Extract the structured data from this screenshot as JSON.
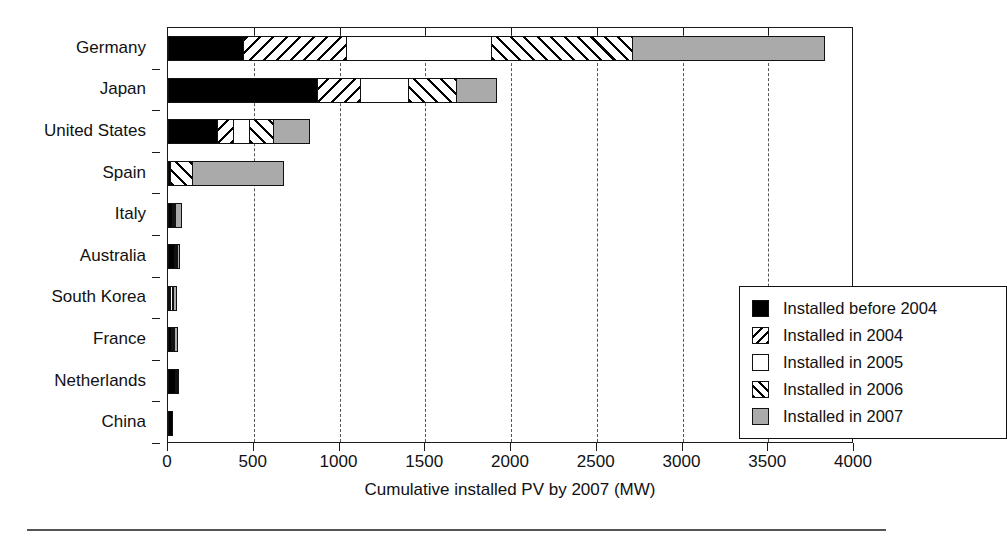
{
  "chart_data": {
    "type": "bar",
    "orientation": "horizontal",
    "stacked": true,
    "title": "",
    "xlabel": "Cumulative installed PV by 2007 (MW)",
    "ylabel": "",
    "xlim": [
      0,
      4000
    ],
    "xticks": [
      0,
      500,
      1000,
      1500,
      2000,
      2500,
      3000,
      3500,
      4000
    ],
    "xticklabels": [
      "0",
      "500",
      "1000",
      "1500",
      "2000",
      "2500",
      "3000",
      "3500",
      "4000"
    ],
    "grid": "vertical-dashed",
    "legend_position": "middle-right-inside",
    "categories": [
      "Germany",
      "Japan",
      "United States",
      "Spain",
      "Italy",
      "Australia",
      "South Korea",
      "France",
      "Netherlands",
      "China"
    ],
    "series": [
      {
        "name": "Installed before 2004",
        "key": "before2004",
        "fill": "solid-black",
        "values": [
          444,
          876,
          292,
          20,
          30,
          44,
          10,
          26,
          46,
          30
        ]
      },
      {
        "name": "Installed in 2004",
        "key": "y2004",
        "fill": "backslash-hatch",
        "values": [
          607,
          257,
          99,
          0,
          5,
          2,
          4,
          5,
          3,
          0
        ]
      },
      {
        "name": "Installed in 2005",
        "key": "y2005",
        "fill": "white",
        "values": [
          853,
          287,
          105,
          0,
          5,
          2,
          16,
          5,
          2,
          0
        ]
      },
      {
        "name": "Installed in 2006",
        "key": "y2006",
        "fill": "forward-slash-hatch",
        "values": [
          829,
          286,
          146,
          132,
          8,
          3,
          6,
          6,
          2,
          0
        ]
      },
      {
        "name": "Installed in 2007",
        "key": "y2007",
        "fill": "grey",
        "values": [
          1127,
          239,
          216,
          537,
          40,
          2,
          28,
          22,
          0,
          0
        ]
      }
    ],
    "totals": [
      3860,
      1945,
      858,
      689,
      88,
      53,
      64,
      64,
      53,
      30
    ],
    "units": "MW",
    "colors": {
      "before2004": "#000000",
      "y2005": "#ffffff",
      "y2007": "#aaaaaa",
      "outline": "#111111",
      "gridline": "#555555",
      "background": "#ffffff"
    }
  },
  "legend": {
    "items": [
      {
        "label": "Installed before 2004",
        "swatch": "solid-black"
      },
      {
        "label": "Installed in 2004",
        "swatch": "backslash-hatch"
      },
      {
        "label": "Installed in 2005",
        "swatch": "white"
      },
      {
        "label": "Installed in 2006",
        "swatch": "forward-slash-hatch"
      },
      {
        "label": "Installed in 2007",
        "swatch": "grey"
      }
    ]
  }
}
